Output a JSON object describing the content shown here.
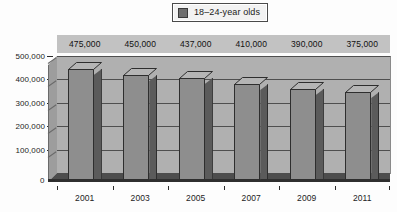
{
  "legend": {
    "label": "18–24-year olds",
    "marker_icon": "legend-square-icon",
    "marker_color": "#6e6e6e"
  },
  "chart_data": {
    "type": "bar",
    "title": "",
    "subtitle": "",
    "xlabel": "",
    "ylabel": "",
    "categories": [
      "2001",
      "2003",
      "2005",
      "2007",
      "2009",
      "2011"
    ],
    "values": [
      475000,
      450000,
      437000,
      410000,
      390000,
      375000
    ],
    "data_labels": [
      "475,000",
      "450,000",
      "437,000",
      "410,000",
      "390,000",
      "375,000"
    ],
    "series": [
      {
        "name": "18–24-year olds",
        "values": [
          475000,
          450000,
          437000,
          410000,
          390000,
          375000
        ]
      }
    ],
    "ylim": [
      0,
      500000
    ],
    "yticks": [
      0,
      100000,
      200000,
      300000,
      400000,
      500000
    ],
    "ytick_labels": [
      "0",
      "100,000",
      "200,000",
      "300,000",
      "400,000",
      "500,000"
    ],
    "grid": "horizontal",
    "legend_position": "top-center",
    "style": "3d-column-grayscale",
    "colors": {
      "bar_front": "#8e8e8e",
      "bar_side": "#5b5b5b",
      "bar_top": "#b5b5b5",
      "bar_outline": "#2e2e2e",
      "plot_background": "#b0b0b0",
      "label_band": "#c2c2c2",
      "gridline": "#4f4f4f",
      "floor": "#4d4d4d",
      "page_background": "#fdfdfd"
    }
  }
}
